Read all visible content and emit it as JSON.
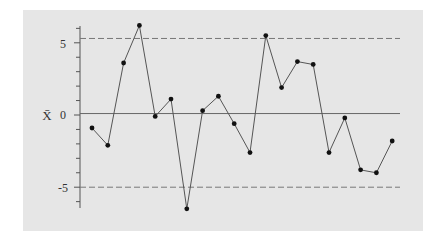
{
  "chart_data": {
    "type": "line",
    "subtype": "control-chart (x-bar)",
    "title": "",
    "xlabel": "",
    "ylabel": "X̄",
    "ylim": [
      -6.5,
      6.3
    ],
    "yticks_labeled": [
      5,
      0,
      -5
    ],
    "yticks_minor": [
      -6,
      -5,
      -4,
      -3,
      -2,
      -1,
      0,
      1,
      2,
      3,
      4,
      5,
      6
    ],
    "grid": false,
    "legend": null,
    "center_line": 0.1,
    "upper_control_limit": 5.3,
    "lower_control_limit": -5.0,
    "x": [
      1,
      2,
      3,
      4,
      5,
      6,
      7,
      8,
      9,
      10,
      11,
      12,
      13,
      14,
      15,
      16,
      17,
      18,
      19,
      20
    ],
    "series": [
      {
        "name": "X-bar",
        "values": [
          -0.9,
          -2.1,
          3.6,
          6.2,
          -0.1,
          1.1,
          -6.5,
          0.3,
          1.3,
          -0.6,
          -2.6,
          5.5,
          1.9,
          3.7,
          3.5,
          -2.6,
          -0.2,
          -3.8,
          -4.0,
          -1.8
        ]
      }
    ],
    "colors": {
      "panel": "#e6e6e6",
      "line": "#555555",
      "marker": "#111111",
      "limits": "#777777"
    }
  },
  "axis": {
    "ylabel": "X̄",
    "tick_labels": {
      "top": "5",
      "mid": "0",
      "bottom": "-5"
    }
  }
}
